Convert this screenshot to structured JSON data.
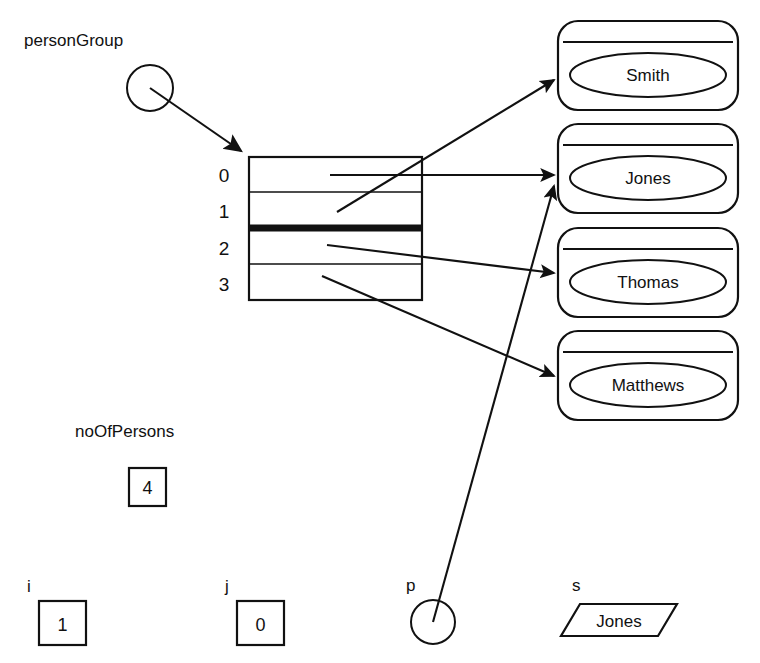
{
  "diagram": {
    "background_color": "#ffffff",
    "line_color": "#111111"
  },
  "pointer_variable": {
    "label": "personGroup",
    "shape": "circle-pointer"
  },
  "array": {
    "name": "personGroup",
    "indices": [
      "0",
      "1",
      "2",
      "3"
    ],
    "separator_after_index": "1",
    "cells": [
      {
        "index": "0",
        "points_to": "Jones"
      },
      {
        "index": "1",
        "points_to": "Smith"
      },
      {
        "index": "2",
        "points_to": "Thomas"
      },
      {
        "index": "3",
        "points_to": "Matthews"
      }
    ]
  },
  "objects": [
    {
      "name": "Smith"
    },
    {
      "name": "Jones"
    },
    {
      "name": "Thomas"
    },
    {
      "name": "Matthews"
    }
  ],
  "variables": [
    {
      "label": "noOfPersons",
      "value": "4",
      "shape": "box"
    },
    {
      "label": "i",
      "value": "1",
      "shape": "box"
    },
    {
      "label": "j",
      "value": "0",
      "shape": "box"
    },
    {
      "label": "p",
      "value": "",
      "shape": "circle-pointer",
      "points_to": "Jones"
    },
    {
      "label": "s",
      "value": "Jones",
      "shape": "parallelogram"
    }
  ]
}
